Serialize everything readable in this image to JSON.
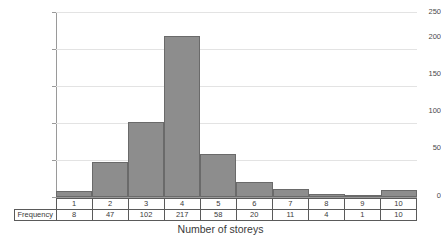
{
  "chart_data": {
    "type": "bar",
    "title": "",
    "xlabel": "Number of storeys",
    "ylabel": "",
    "categories": [
      "1",
      "2",
      "3",
      "4",
      "5",
      "6",
      "7",
      "8",
      "9",
      "10"
    ],
    "values": [
      8,
      47,
      102,
      217,
      58,
      20,
      11,
      4,
      1,
      10
    ],
    "ylim": [
      0,
      250
    ],
    "yticks": [
      "0",
      "50",
      "100",
      "150",
      "200",
      "250"
    ],
    "ytick_values": [
      0,
      50,
      100,
      150,
      200,
      250
    ],
    "grid": true,
    "legend": "none",
    "bar_fill_color": "#8d8d8d",
    "bar_border_color": "#6a6a6a",
    "gridline_color": "#e3e3e3",
    "axis_color": "#9a9a9a"
  },
  "table": {
    "row_label": "Frequency",
    "categories": [
      "1",
      "2",
      "3",
      "4",
      "5",
      "6",
      "7",
      "8",
      "9",
      "10"
    ],
    "frequencies": [
      "8",
      "47",
      "102",
      "217",
      "58",
      "20",
      "11",
      "4",
      "1",
      "10"
    ]
  }
}
